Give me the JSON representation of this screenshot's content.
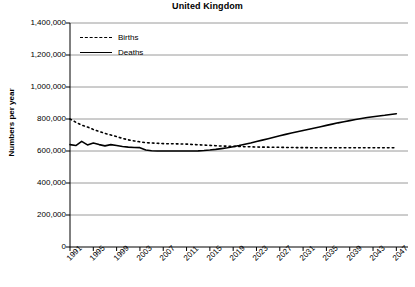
{
  "chart_data": {
    "type": "line",
    "title": "United Kingdom",
    "xlabel": "",
    "ylabel": "Numbers per year",
    "ylim": [
      0,
      1400000
    ],
    "yticks": [
      "0",
      "200,000",
      "400,000",
      "600,000",
      "800,000",
      "1,000,000",
      "1,200,000",
      "1,400,000"
    ],
    "ytick_values": [
      0,
      200000,
      400000,
      600000,
      800000,
      1000000,
      1200000,
      1400000
    ],
    "xlim": [
      1991,
      2049
    ],
    "xticks": [
      "1991",
      "1995",
      "1999",
      "2003",
      "2007",
      "2011",
      "2015",
      "2019",
      "2023",
      "2027",
      "2031",
      "2035",
      "2039",
      "2043",
      "2047"
    ],
    "xtick_values": [
      1991,
      1995,
      1999,
      2003,
      2007,
      2011,
      2015,
      2019,
      2023,
      2027,
      2031,
      2035,
      2039,
      2043,
      2047
    ],
    "grid": true,
    "legend_position": "top-left",
    "x": [
      1991,
      1992,
      1993,
      1994,
      1995,
      1996,
      1997,
      1998,
      1999,
      2000,
      2001,
      2002,
      2003,
      2004,
      2005,
      2006,
      2007,
      2008,
      2009,
      2010,
      2011,
      2012,
      2013,
      2014,
      2015,
      2016,
      2017,
      2018,
      2019,
      2020,
      2021,
      2022,
      2023,
      2024,
      2025,
      2026,
      2027,
      2028,
      2029,
      2030,
      2031,
      2032,
      2033,
      2034,
      2035,
      2036,
      2037,
      2038,
      2039,
      2040,
      2041,
      2042,
      2043,
      2044,
      2045,
      2046,
      2047
    ],
    "series": [
      {
        "name": "Births",
        "style": "dashed",
        "color": "#000000",
        "values": [
          800000,
          780000,
          762000,
          750000,
          735000,
          722000,
          710000,
          700000,
          690000,
          679000,
          670000,
          663000,
          657000,
          652000,
          650000,
          648000,
          646000,
          645000,
          645000,
          644000,
          643000,
          641000,
          639000,
          637000,
          635000,
          633000,
          631000,
          630000,
          629000,
          628000,
          627000,
          626000,
          625000,
          624000,
          624000,
          623000,
          623000,
          622000,
          622000,
          621000,
          621000,
          621000,
          620000,
          620000,
          620000,
          620000,
          620000,
          620000,
          620000,
          620000,
          620000,
          620000,
          620000,
          620000,
          620000,
          620000,
          620000
        ]
      },
      {
        "name": "Deaths",
        "style": "solid",
        "color": "#000000",
        "values": [
          640000,
          634000,
          660000,
          638000,
          650000,
          640000,
          632000,
          640000,
          634000,
          628000,
          624000,
          622000,
          621000,
          606000,
          602000,
          600000,
          600000,
          600000,
          600000,
          600000,
          600000,
          600000,
          601000,
          603000,
          606000,
          610000,
          615000,
          620000,
          627000,
          634000,
          642000,
          650000,
          659000,
          668000,
          677000,
          686000,
          695000,
          704000,
          712000,
          720000,
          728000,
          736000,
          744000,
          752000,
          760000,
          768000,
          776000,
          783000,
          790000,
          797000,
          803000,
          809000,
          814000,
          819000,
          823000,
          828000,
          833000
        ]
      }
    ],
    "legend": [
      {
        "label": "Births",
        "style": "dashed"
      },
      {
        "label": "Deaths",
        "style": "solid"
      }
    ]
  }
}
